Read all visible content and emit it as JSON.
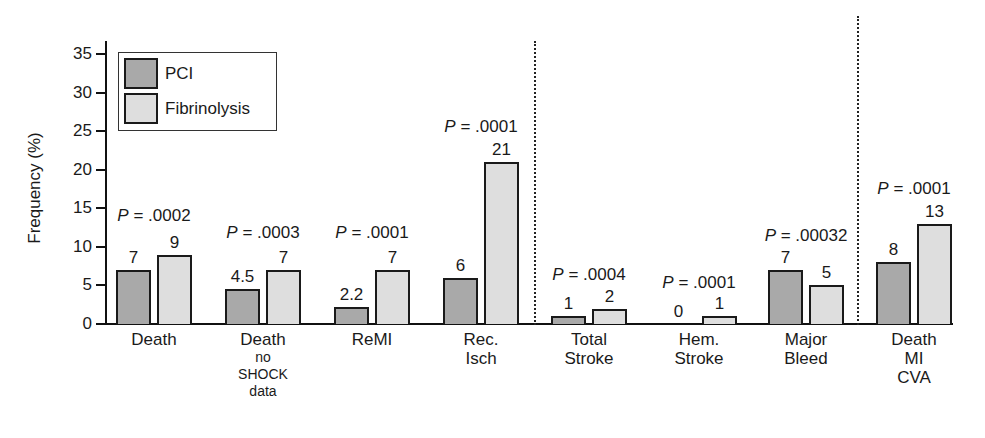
{
  "chart_data": {
    "type": "bar",
    "title": "",
    "xlabel": "",
    "ylabel": "Frequency (%)",
    "ylim": [
      0,
      35
    ],
    "yticks": [
      0,
      5,
      10,
      15,
      20,
      25,
      30,
      35
    ],
    "grid": false,
    "legend_position": "top-left (inside)",
    "categories": [
      {
        "label": "Death",
        "sub": ""
      },
      {
        "label": "Death",
        "sub": "no SHOCK data"
      },
      {
        "label": "ReMI",
        "sub": ""
      },
      {
        "label": "Rec. Isch",
        "sub": ""
      },
      {
        "label": "Total Stroke",
        "sub": ""
      },
      {
        "label": "Hem. Stroke",
        "sub": ""
      },
      {
        "label": "Major Bleed",
        "sub": ""
      },
      {
        "label": "Death MI CVA",
        "sub": ""
      }
    ],
    "series": [
      {
        "name": "PCI",
        "color": "#a9a9a9",
        "values": [
          7,
          4.5,
          2.2,
          6,
          1,
          0,
          7,
          8
        ],
        "labels": [
          "7",
          "4.5",
          "2.2",
          "6",
          "1",
          "0",
          "7",
          "8"
        ]
      },
      {
        "name": "Fibrinolysis",
        "color": "#dedede",
        "values": [
          9,
          7,
          7,
          21,
          2,
          1,
          5,
          13
        ],
        "labels": [
          "9",
          "7",
          "7",
          "21",
          "2",
          "1",
          "5",
          "13"
        ]
      }
    ],
    "p_values": [
      ".0002",
      ".0003",
      ".0001",
      ".0001",
      ".0004",
      ".0001",
      ".00032",
      ".0001"
    ],
    "annotations": [
      "Dotted vertical separator between Rec. Isch and Total Stroke",
      "Dotted vertical separator between Major Bleed and Death MI CVA"
    ]
  },
  "ui": {
    "p_prefix": "P",
    "p_equals": " = ",
    "cat_lines": [
      [
        "Death"
      ],
      [
        "Death"
      ],
      [
        "ReMI"
      ],
      [
        "Rec.",
        "Isch"
      ],
      [
        "Total",
        "Stroke"
      ],
      [
        "Hem.",
        "Stroke"
      ],
      [
        "Major",
        "Bleed"
      ],
      [
        "Death",
        "MI",
        "CVA"
      ]
    ],
    "cat_sub_lines": [
      [],
      [
        "no",
        "SHOCK",
        "data"
      ],
      [],
      [],
      [],
      [],
      [],
      []
    ]
  }
}
